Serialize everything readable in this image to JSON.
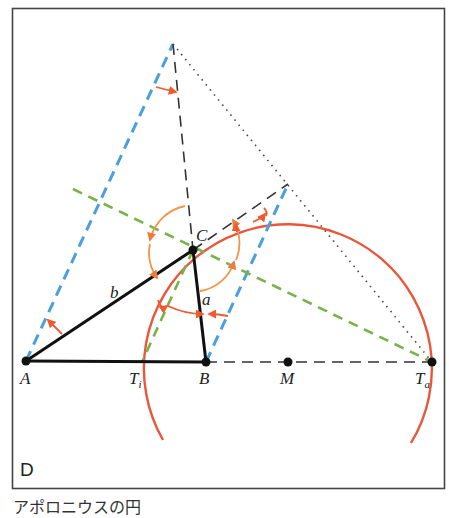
{
  "figure": {
    "panel_label": "D",
    "caption": "アポロニウスの円",
    "points": {
      "A": {
        "label": "A",
        "x": 26,
        "y": 361
      },
      "B": {
        "label": "B",
        "x": 206,
        "y": 362
      },
      "C": {
        "label": "C",
        "x": 193,
        "y": 250
      },
      "M": {
        "label": "M",
        "x": 288,
        "y": 362
      },
      "Ti": {
        "label": "T",
        "sub": "i",
        "x": 142,
        "y": 362
      },
      "Ta": {
        "label": "T",
        "sub": "a",
        "x": 432,
        "y": 362
      }
    },
    "sides": {
      "a": "a",
      "b": "b"
    },
    "colors": {
      "frame": "#444444",
      "triangle": "#111111",
      "circle": "#e8573a",
      "angle_arrows": "#ef6a3c",
      "angle_arcs": "#f0954a",
      "blue_dashed": "#4a9fdc",
      "green_dashed": "#78b24a",
      "black_dashed": "#333333",
      "dotted": "#444444"
    }
  }
}
